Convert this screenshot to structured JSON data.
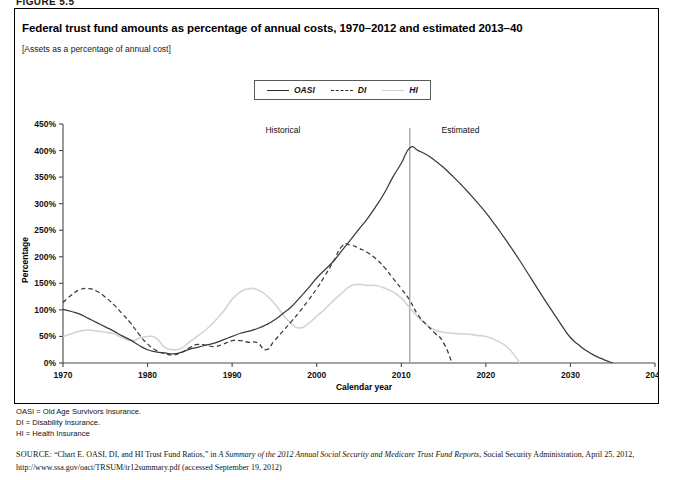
{
  "figure": {
    "label": "FIGURE 5.5",
    "title": "Federal trust fund amounts as percentage of annual costs, 1970–2012 and estimated 2013–40",
    "subtitle": "[Assets as a percentage of annual cost]"
  },
  "legend": {
    "position": "top-center",
    "items": [
      {
        "label": "OASI",
        "style": "solid",
        "color": "#3a3a3a",
        "icon": "line-solid-icon"
      },
      {
        "label": "DI",
        "style": "dashed",
        "color": "#3a3a3a",
        "icon": "line-dashed-icon"
      },
      {
        "label": "HI",
        "style": "solid-light",
        "color": "#d4d4d4",
        "icon": "line-light-icon"
      }
    ]
  },
  "annotations": [
    {
      "text": "Historical",
      "x": 1996
    },
    {
      "text": "Estimated",
      "x": 2017
    }
  ],
  "divider": {
    "x": 2011
  },
  "notes": [
    "OASI = Old Age Survivors Insurance.",
    "DI = Disability Insurance.",
    "HI = Health Insurance"
  ],
  "source": {
    "prefix": "SOURCE:",
    "text_1": " “Chart E. OASI, DI, and HI Trust Fund Ratios,” in ",
    "italic_1": "A Summary of the 2012 Annual Social Security and Medicare Trust Fund Reports",
    "text_2": ", Social Security Administration, April 25, 2012, http://www.ssa.gov/oact/TRSUM/tr12summary.pdf (accessed September 19, 2012)"
  },
  "chart_data": {
    "type": "line",
    "title": "Federal trust fund amounts as percentage of annual costs, 1970–2012 and estimated 2013–40",
    "xlabel": "Calendar year",
    "ylabel": "Percentage",
    "xlim": [
      1970,
      2040
    ],
    "ylim": [
      0,
      450
    ],
    "xticks": [
      1970,
      1980,
      1990,
      2000,
      2010,
      2020,
      2030,
      2040
    ],
    "xtick_labels": [
      "1970",
      "1980",
      "1990",
      "2000",
      "2010",
      "2020",
      "2030",
      "2040"
    ],
    "yticks": [
      0,
      50,
      100,
      150,
      200,
      250,
      300,
      350,
      400,
      450
    ],
    "ytick_labels": [
      "0%",
      "50%",
      "100%",
      "150%",
      "200%",
      "250%",
      "300%",
      "350%",
      "400%",
      "450%"
    ],
    "grid": false,
    "legend_position": "top-center",
    "series": [
      {
        "name": "OASI",
        "style": "solid",
        "color": "#3a3a3a",
        "x": [
          1970,
          1971,
          1972,
          1973,
          1974,
          1975,
          1976,
          1977,
          1978,
          1979,
          1980,
          1981,
          1982,
          1983,
          1984,
          1985,
          1986,
          1987,
          1988,
          1989,
          1990,
          1991,
          1992,
          1993,
          1994,
          1995,
          1996,
          1997,
          1998,
          1999,
          2000,
          2001,
          2002,
          2003,
          2004,
          2005,
          2006,
          2007,
          2008,
          2009,
          2010,
          2011,
          2012,
          2013,
          2014,
          2015,
          2016,
          2017,
          2018,
          2019,
          2020,
          2021,
          2022,
          2023,
          2024,
          2025,
          2026,
          2027,
          2028,
          2029,
          2030,
          2031,
          2032,
          2033,
          2034,
          2035
        ],
        "y": [
          101,
          97,
          92,
          84,
          76,
          68,
          60,
          51,
          43,
          33,
          25,
          21,
          19,
          17,
          20,
          26,
          30,
          34,
          38,
          44,
          50,
          56,
          60,
          65,
          72,
          81,
          93,
          106,
          123,
          141,
          160,
          176,
          192,
          212,
          232,
          252,
          272,
          295,
          320,
          350,
          376,
          405,
          400,
          392,
          381,
          368,
          353,
          337,
          320,
          302,
          283,
          262,
          240,
          217,
          193,
          168,
          143,
          118,
          94,
          70,
          48,
          34,
          22,
          13,
          6,
          0
        ]
      },
      {
        "name": "DI",
        "style": "dashed",
        "color": "#3a3a3a",
        "x": [
          1970,
          1971,
          1972,
          1973,
          1974,
          1975,
          1976,
          1977,
          1978,
          1979,
          1980,
          1981,
          1982,
          1983,
          1984,
          1985,
          1986,
          1987,
          1988,
          1989,
          1990,
          1991,
          1992,
          1993,
          1994,
          1995,
          1996,
          1997,
          1998,
          1999,
          2000,
          2001,
          2002,
          2003,
          2004,
          2005,
          2006,
          2007,
          2008,
          2009,
          2010,
          2011,
          2012,
          2013,
          2014,
          2015,
          2016
        ],
        "y": [
          114,
          128,
          138,
          140,
          135,
          124,
          110,
          93,
          75,
          54,
          36,
          24,
          18,
          15,
          20,
          29,
          35,
          33,
          31,
          36,
          42,
          42,
          39,
          38,
          25,
          42,
          60,
          78,
          97,
          118,
          140,
          165,
          192,
          220,
          222,
          216,
          208,
          196,
          180,
          160,
          140,
          118,
          90,
          72,
          56,
          38,
          0
        ]
      },
      {
        "name": "HI",
        "style": "solid-light",
        "color": "#d4d4d4",
        "x": [
          1970,
          1971,
          1972,
          1973,
          1974,
          1975,
          1976,
          1977,
          1978,
          1979,
          1980,
          1981,
          1982,
          1983,
          1984,
          1985,
          1986,
          1987,
          1988,
          1989,
          1990,
          1991,
          1992,
          1993,
          1994,
          1995,
          1996,
          1997,
          1998,
          1999,
          2000,
          2001,
          2002,
          2003,
          2004,
          2005,
          2006,
          2007,
          2008,
          2009,
          2010,
          2011,
          2012,
          2013,
          2014,
          2015,
          2016,
          2017,
          2018,
          2019,
          2020,
          2021,
          2022,
          2023,
          2024
        ],
        "y": [
          50,
          55,
          60,
          62,
          60,
          58,
          55,
          48,
          42,
          46,
          50,
          47,
          30,
          25,
          28,
          40,
          52,
          64,
          80,
          98,
          120,
          134,
          140,
          138,
          128,
          112,
          92,
          74,
          66,
          74,
          88,
          102,
          118,
          132,
          145,
          148,
          146,
          146,
          141,
          134,
          122,
          104,
          86,
          72,
          62,
          58,
          56,
          55,
          54,
          52,
          50,
          44,
          36,
          22,
          0
        ]
      }
    ]
  }
}
